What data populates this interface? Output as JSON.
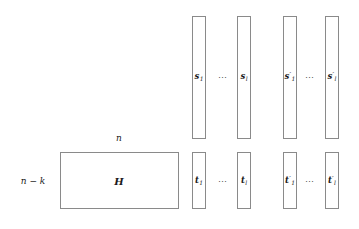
{
  "figure": {
    "matrix": {
      "name": "H",
      "width_label": "n",
      "height_label": "n − k"
    },
    "ellipsis": "⋯",
    "top_row": {
      "first": {
        "base": "s",
        "sub": "1",
        "prime": ""
      },
      "last": {
        "base": "s",
        "sub": "l",
        "prime": ""
      },
      "first_primed": {
        "base": "s",
        "sub": "1",
        "prime": "′"
      },
      "last_primed": {
        "base": "s",
        "sub": "l",
        "prime": "′"
      }
    },
    "bottom_row": {
      "first": {
        "base": "t",
        "sub": "1",
        "prime": ""
      },
      "last": {
        "base": "t",
        "sub": "l",
        "prime": ""
      },
      "first_primed": {
        "base": "t",
        "sub": "1",
        "prime": "′"
      },
      "last_primed": {
        "base": "t",
        "sub": "l",
        "prime": "′"
      }
    },
    "colors": {
      "stroke": "#8a8a8a",
      "text": "#1a1a1a",
      "background": "#ffffff"
    }
  }
}
